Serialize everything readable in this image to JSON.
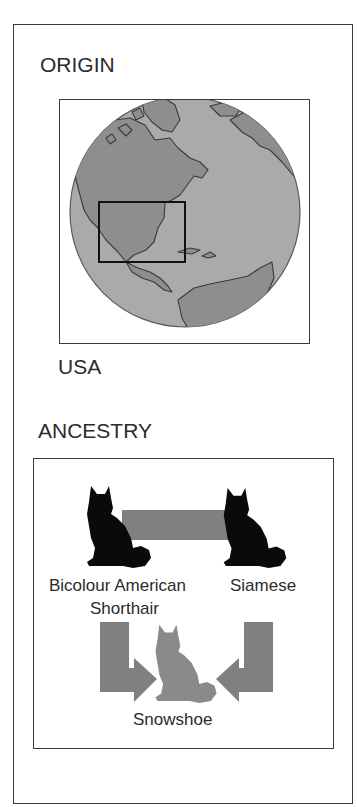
{
  "panel": {
    "origin": {
      "heading": "ORIGIN",
      "country": "USA",
      "map": {
        "icon": "globe-north-america",
        "highlight_region": "United States",
        "ocean_color": "#a9a9a9",
        "land_color": "#8e8e8e",
        "outline_color": "#3a3a3a"
      }
    },
    "ancestry": {
      "heading": "ANCESTRY",
      "parents": [
        {
          "name_line1": "Bicolour American",
          "name_line2": "Shorthair",
          "icon": "black-cat-silhouette"
        },
        {
          "name": "Siamese",
          "icon": "black-cat-silhouette"
        }
      ],
      "offspring": {
        "name": "Snowshoe",
        "icon": "gray-cat-silhouette"
      },
      "colors": {
        "parent_cat": "#0a0a0a",
        "connector": "#808080",
        "offspring_cat": "#8a8a8a"
      }
    }
  }
}
